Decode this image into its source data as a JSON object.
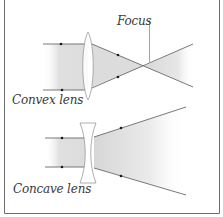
{
  "diagram": {
    "labels": {
      "focus": "Focus",
      "convex": "Convex lens",
      "concave": "Concave lens"
    },
    "colors": {
      "border": "#6e6e6e",
      "ray": "#6a6a6a",
      "dot": "#1a1a1a",
      "beam_fill": "#d9d9d9",
      "lens_stroke": "#9a9a9a",
      "text": "#3a3a3a"
    }
  }
}
